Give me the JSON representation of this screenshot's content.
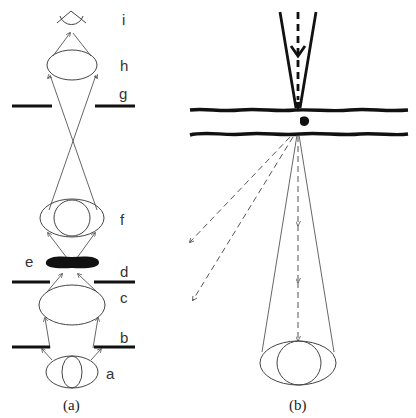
{
  "figure": {
    "panel_a": {
      "caption": "(a)",
      "labels": {
        "a": "a",
        "b": "b",
        "c": "c",
        "d": "d",
        "e": "e",
        "f": "f",
        "g": "g",
        "h": "h",
        "i": "i"
      }
    },
    "panel_b": {
      "caption": "(b)"
    },
    "colors": {
      "ink": "#111111",
      "line": "#555555",
      "background": "#ffffff"
    }
  }
}
